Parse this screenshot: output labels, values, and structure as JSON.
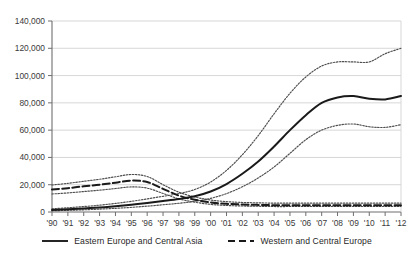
{
  "chart_data": {
    "type": "line",
    "title": "",
    "subtitle": "",
    "xlabel": "",
    "ylabel": "",
    "grid": true,
    "legend_position": "bottom",
    "x": [
      1990,
      1991,
      1992,
      1993,
      1994,
      1995,
      1996,
      1997,
      1998,
      1999,
      2000,
      2001,
      2002,
      2003,
      2004,
      2005,
      2006,
      2007,
      2008,
      2009,
      2010,
      2011,
      2012
    ],
    "x_tick_labels": [
      "'90",
      "'91",
      "'92",
      "'93",
      "'94",
      "'95",
      "'96",
      "'97",
      "'98",
      "'99",
      "'00",
      "'01",
      "'02",
      "'03",
      "'04",
      "'05",
      "'06",
      "'07",
      "'08",
      "'09",
      "'10",
      "'11",
      "'12"
    ],
    "y_tick_labels": [
      "0",
      "20,000",
      "40,000",
      "60,000",
      "80,000",
      "100,000",
      "120,000",
      "140,000"
    ],
    "y_ticks": [
      0,
      20000,
      40000,
      60000,
      80000,
      100000,
      120000,
      140000
    ],
    "ylim": [
      0,
      140000
    ],
    "xlim": [
      1990,
      2012
    ],
    "series": [
      {
        "name": "Eastern Europe and Central Asia",
        "style": "solid",
        "color": "#1a1a1a",
        "values": [
          1500,
          2000,
          2600,
          3300,
          4200,
          5300,
          6600,
          8000,
          9500,
          11500,
          15000,
          20500,
          28000,
          37000,
          48000,
          60000,
          71000,
          80000,
          84000,
          85000,
          83000,
          82500,
          85000
        ]
      },
      {
        "name": "Eastern Europe and Central Asia upper bound",
        "style": "dotted",
        "color": "#4d4d4d",
        "bound_for": "Eastern Europe and Central Asia",
        "values": [
          2400,
          3100,
          4000,
          5000,
          6300,
          7800,
          9600,
          11500,
          13500,
          16500,
          22000,
          30500,
          42000,
          56000,
          72000,
          87000,
          99000,
          107000,
          110000,
          110000,
          110000,
          116000,
          120000
        ]
      },
      {
        "name": "Eastern Europe and Central Asia lower bound",
        "style": "dotted",
        "color": "#4d4d4d",
        "bound_for": "Eastern Europe and Central Asia",
        "values": [
          900,
          1200,
          1600,
          2100,
          2700,
          3400,
          4300,
          5300,
          6400,
          7800,
          10000,
          13500,
          18500,
          25000,
          33000,
          43000,
          53000,
          60000,
          63500,
          64500,
          62500,
          62000,
          64000
        ]
      },
      {
        "name": "Western and Central Europe",
        "style": "dashed",
        "color": "#1a1a1a",
        "values": [
          16500,
          17500,
          18800,
          20000,
          21500,
          23000,
          22000,
          17000,
          12000,
          9000,
          7000,
          6000,
          5500,
          5200,
          5000,
          5000,
          5000,
          5000,
          5000,
          5000,
          5000,
          5000,
          5000
        ]
      },
      {
        "name": "Western and Central Europe upper bound",
        "style": "dotted",
        "color": "#4d4d4d",
        "bound_for": "Western and Central Europe",
        "values": [
          19800,
          21000,
          22500,
          24000,
          25800,
          27500,
          26000,
          20000,
          14500,
          11000,
          8800,
          7600,
          7000,
          6700,
          6500,
          6500,
          6500,
          6500,
          6500,
          6500,
          6500,
          6500,
          6500
        ]
      },
      {
        "name": "Western and Central Europe lower bound",
        "style": "dotted",
        "color": "#4d4d4d",
        "bound_for": "Western and Central Europe",
        "values": [
          13200,
          14000,
          15000,
          16000,
          17200,
          18400,
          17500,
          13600,
          9600,
          7200,
          5600,
          4800,
          4400,
          4200,
          4000,
          4000,
          4000,
          4000,
          4000,
          4000,
          4000,
          4000,
          4000
        ]
      }
    ],
    "legend": [
      {
        "label": "Eastern Europe and Central Asia",
        "style": "solid"
      },
      {
        "label": "Western and Central Europe",
        "style": "dashed"
      }
    ]
  },
  "colors": {
    "axis": "#6e6e6e",
    "grid": "#d2d2d2",
    "series_primary": "#1a1a1a",
    "bounds": "#4d4d4d",
    "text": "#2b2b2b",
    "background": "#ffffff"
  }
}
